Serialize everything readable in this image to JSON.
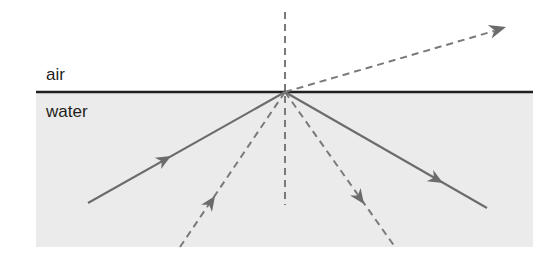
{
  "figure": {
    "background_color": "#ffffff",
    "width": 541,
    "height": 256
  },
  "media": {
    "upper": {
      "name": "air",
      "label": "air",
      "label_x": 46,
      "label_y": 80,
      "fill_color": "#ffffff"
    },
    "lower": {
      "name": "water",
      "label": "water",
      "label_x": 46,
      "label_y": 117,
      "fill_color": "#ebebeb"
    }
  },
  "interface": {
    "name": "air-water-boundary",
    "color": "#231f20",
    "thickness": 2.4,
    "x1": 36,
    "x2": 533,
    "y": 92
  },
  "water_region": {
    "x": 36,
    "y": 93,
    "width": 497,
    "height": 154,
    "color": "#ebebeb"
  },
  "incidence_point": {
    "name": "point-of-incidence",
    "x": 285,
    "y": 92
  },
  "normal_line": {
    "name": "normal",
    "label": "normal",
    "style": "dashed",
    "color": "#7a7a7a",
    "x": 285,
    "y_top": 12,
    "y_bottom": 205,
    "dash": "7 5"
  },
  "rays": [
    {
      "id": "incident-ray",
      "label": "incident ray",
      "style": "solid",
      "color": "#6b6b6b",
      "x1": 88,
      "y1": 203,
      "x2": 285,
      "y2": 92,
      "arrow_at": 0.42,
      "arrow_direction": "up-right"
    },
    {
      "id": "refracted-ray",
      "label": "refracted ray",
      "style": "dashed",
      "color": "#7a7a7a",
      "x1": 285,
      "y1": 92,
      "x2": 504,
      "y2": 28,
      "arrow_at": 1.0,
      "arrow_direction": "up-right"
    },
    {
      "id": "reflected-ray",
      "label": "reflected ray",
      "style": "solid",
      "color": "#6b6b6b",
      "x1": 285,
      "y1": 92,
      "x2": 487,
      "y2": 208,
      "arrow_at": 0.78,
      "arrow_direction": "down-right"
    },
    {
      "id": "dashed-ray-left",
      "label": "construction ray left",
      "style": "dashed",
      "color": "#7a7a7a",
      "x1": 180,
      "y1": 247,
      "x2": 285,
      "y2": 92,
      "arrow_at": 0.33,
      "arrow_direction": "up-right"
    },
    {
      "id": "dashed-ray-right",
      "label": "construction ray right",
      "style": "dashed",
      "color": "#7a7a7a",
      "x1": 285,
      "y1": 92,
      "x2": 395,
      "y2": 247,
      "arrow_at": 0.72,
      "arrow_direction": "down-right"
    }
  ]
}
